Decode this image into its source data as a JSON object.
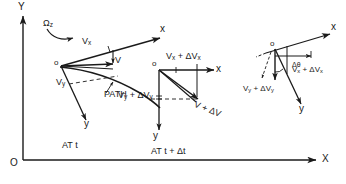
{
  "figure": {
    "background_color": "#ffffff",
    "ink_color": "#1a1a1a"
  },
  "global_axes": {
    "y_axis_label": "Y",
    "x_axis_label": "X",
    "origin_label": "O"
  },
  "time_captions": {
    "left": "AT t",
    "right": "AT t + Δt"
  },
  "frame_at_t": {
    "origin_label": "o",
    "x_axis_label": "x",
    "y_axis_label": "y",
    "angular_velocity_label": "Ω",
    "angular_velocity_sub": "z",
    "vx_label": "V",
    "vx_sub": "x",
    "vy_label": "V",
    "vy_sub": "y",
    "v_label": "V",
    "path_label": "PATH"
  },
  "frame_at_t_plus_dt": {
    "origin_label": "o",
    "x_axis_label": "x",
    "y_axis_label": "y",
    "vx_label": "V",
    "vx_sub": "x",
    "vx_delta": " + ΔV",
    "vx_delta_sub": "x",
    "vy_label": "V",
    "vy_sub": "y",
    "vy_delta": " + ΔV",
    "vy_delta_sub": "y",
    "v_label": "V + ΔV"
  },
  "inset_rotated_frame": {
    "origin_label": "o",
    "x_axis_label": "x",
    "y_axis_label": "y",
    "vx_label": "V",
    "vx_sub": "x",
    "vx_delta": " + ΔV",
    "vx_delta_sub": "x",
    "vy_label": "V",
    "vy_sub": "y",
    "vy_delta": " + ΔV",
    "vy_delta_sub": "y",
    "angle_label": "Δθ"
  }
}
